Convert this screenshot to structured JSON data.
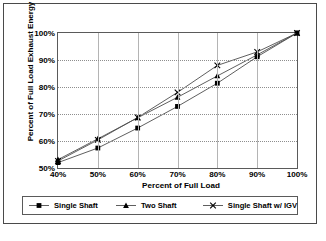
{
  "chart_data": {
    "type": "line",
    "title": "",
    "xlabel": "Percent of Full Load",
    "ylabel": "Percent of Full Load Exhaust Energy",
    "x": [
      40,
      50,
      60,
      70,
      80,
      90,
      100
    ],
    "xtick_labels": [
      "40%",
      "50%",
      "60%",
      "70%",
      "80%",
      "90%",
      "100%"
    ],
    "ytick_labels": [
      "50%",
      "60%",
      "70%",
      "80%",
      "90%",
      "100%"
    ],
    "yticks": [
      50,
      60,
      70,
      80,
      90,
      100
    ],
    "xlim": [
      40,
      100
    ],
    "ylim": [
      50,
      100
    ],
    "grid": true,
    "legend_position": "bottom",
    "series": [
      {
        "name": "Single Shaft",
        "marker": "square",
        "values": [
          52.0,
          57.4,
          64.8,
          72.8,
          81.4,
          91.2,
          100.0
        ]
      },
      {
        "name": "Two Shaft",
        "marker": "triangle",
        "values": [
          53.1,
          60.8,
          68.6,
          76.2,
          84.1,
          91.9,
          100.0
        ]
      },
      {
        "name": "Single Shaft w/ IGV",
        "marker": "x",
        "values": [
          52.6,
          60.4,
          68.7,
          78.0,
          88.0,
          93.0,
          100.0
        ]
      }
    ]
  },
  "axes": {
    "x_title": "Percent of Full Load",
    "y_title": "Percent of Full Load Exhaust Energy"
  },
  "legend": {
    "entries": [
      {
        "label": "Single Shaft"
      },
      {
        "label": "Two Shaft"
      },
      {
        "label": "Single Shaft w/ IGV"
      }
    ]
  },
  "colors": {
    "series_line": "#4d4d4d",
    "marker": "#000000",
    "grid": "#b4b4b4",
    "axis": "#5a5a5a",
    "text": "#000000",
    "background": "#ffffff"
  }
}
